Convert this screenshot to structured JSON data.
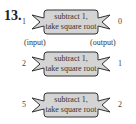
{
  "problem_number": "13.",
  "labels": {
    "input": "(input)",
    "output": "(output)"
  },
  "machine_text": [
    "subtract 1,",
    "take square root"
  ],
  "machines": [
    {
      "input": "1",
      "output": "0",
      "line1": "subtract 1,",
      "line2": "take square root"
    },
    {
      "input": "2",
      "output": "1",
      "line1": "subtract 1,",
      "line2": "take square root"
    },
    {
      "input": "5",
      "output": "2",
      "line1": "subtract 1,",
      "line2": "take square root"
    }
  ],
  "colors": {
    "machine_fill": "#d4d4d4",
    "machine_stroke": "#333333"
  }
}
